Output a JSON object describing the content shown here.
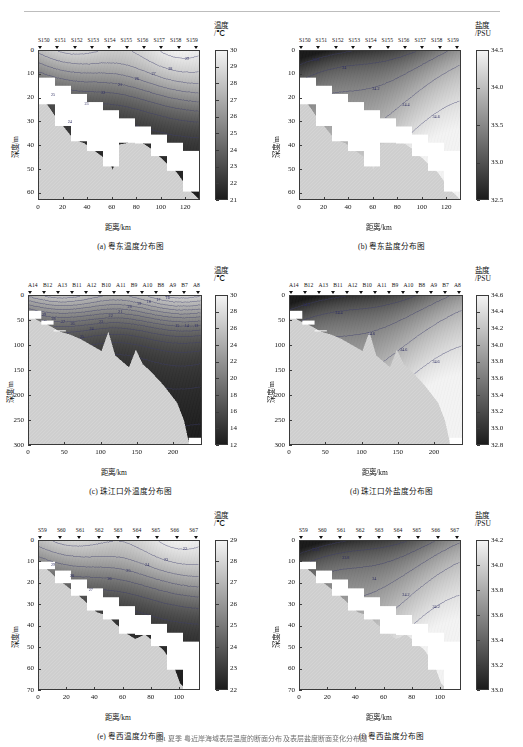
{
  "header": {
    "running_head": "",
    "figure_caption": "图1  夏季  粤近岸海域表层温度的断面分布  及表层盐度断面变化分布图"
  },
  "axis_labels": {
    "x": "距离/km",
    "y_depth": "深度/m",
    "temp_unit": "温度\n/℃",
    "temp_unit_line1": "温度",
    "temp_unit_line2": "/℃",
    "sal_unit_line1": "盐度",
    "sal_unit_line2": "/PSU"
  },
  "panels": [
    {
      "id": "a",
      "caption": "(a) 粤东温度分布图",
      "variable": "temperature",
      "stations": [
        "S150",
        "S151",
        "S152",
        "S153",
        "S154",
        "S155",
        "S156",
        "S157",
        "S158",
        "S159"
      ],
      "colorbar": {
        "title_l1": "温度",
        "title_l2": "/℃",
        "ticks": [
          30,
          29,
          28,
          27,
          26,
          25,
          24,
          23,
          22,
          21
        ],
        "min": 21,
        "max": 30
      },
      "chart_data": {
        "type": "heatmap",
        "title": "(a) 粤东温度分布图",
        "xlabel": "距离/km",
        "ylabel": "深度/m",
        "xlim": [
          0,
          132
        ],
        "ylim": [
          0,
          63
        ],
        "xticks": [
          0,
          20,
          40,
          60,
          80,
          100,
          120
        ],
        "yticks": [
          0,
          10,
          20,
          30,
          40,
          50,
          60
        ],
        "zlabel": "温度/℃",
        "zlim": [
          21,
          30
        ],
        "grid": false,
        "legend": "colorbar-right",
        "station_positions_km": [
          5,
          14,
          29,
          43,
          57,
          71,
          86,
          100,
          117,
          130
        ],
        "contour_levels": [
          21,
          22,
          23,
          24,
          25,
          26,
          27,
          28,
          29
        ],
        "contour_labels": [
          "25",
          "24",
          "23",
          "22",
          "21",
          "26",
          "27",
          "28",
          "29"
        ],
        "description": "粤东断面温度垂向分布，表层约30℃，底层约21℃，温跃层位于10-20 m"
      }
    },
    {
      "id": "b",
      "caption": "(b) 粤东盐度分布图",
      "variable": "salinity",
      "stations": [
        "S150",
        "S151",
        "S152",
        "S153",
        "S154",
        "S155",
        "S156",
        "S157",
        "S158",
        "S159"
      ],
      "colorbar": {
        "title_l1": "盐度",
        "title_l2": "/PSU",
        "ticks": [
          34.5,
          34.0,
          33.5,
          33.0,
          32.5
        ],
        "min": 32.5,
        "max": 34.5
      },
      "chart_data": {
        "type": "heatmap",
        "title": "(b) 粤东盐度分布图",
        "xlabel": "距离/km",
        "ylabel": "深度/m",
        "xlim": [
          0,
          132
        ],
        "ylim": [
          0,
          63
        ],
        "xticks": [
          0,
          20,
          40,
          60,
          80,
          100,
          120
        ],
        "yticks": [
          0,
          10,
          20,
          30,
          40,
          50,
          60
        ],
        "zlabel": "盐度/PSU",
        "zlim": [
          32.5,
          34.5
        ],
        "grid": false,
        "legend": "colorbar-right",
        "station_positions_km": [
          5,
          14,
          29,
          43,
          57,
          71,
          86,
          100,
          117,
          130
        ],
        "contour_levels": [
          33.8,
          34.0,
          34.2,
          34.4,
          34.6
        ],
        "contour_labels": [
          "33.8",
          "34",
          "34.2",
          "34.4",
          "34.6"
        ],
        "description": "粤东断面盐度垂向分布，近表层盐度较低，深层约34.5 PSU"
      }
    },
    {
      "id": "c",
      "caption": "(c) 珠江口外温度分布图",
      "variable": "temperature",
      "stations": [
        "A14",
        "B12",
        "A13",
        "B11",
        "A12",
        "B10",
        "A11",
        "B9",
        "A10",
        "B8",
        "A9",
        "B7",
        "A8"
      ],
      "colorbar": {
        "title_l1": "温度",
        "title_l2": "/℃",
        "ticks": [
          30,
          28,
          26,
          24,
          22,
          20,
          18,
          16,
          14,
          12
        ],
        "min": 12,
        "max": 30
      },
      "chart_data": {
        "type": "heatmap",
        "title": "(c) 珠江口外温度分布图",
        "xlabel": "距离/km",
        "ylabel": "深度/m",
        "xlim": [
          0,
          240
        ],
        "ylim": [
          0,
          300
        ],
        "xticks": [
          0,
          50,
          100,
          150,
          200
        ],
        "yticks": [
          0,
          50,
          100,
          150,
          200,
          250,
          300
        ],
        "zlabel": "温度/℃",
        "zlim": [
          12,
          30
        ],
        "grid": false,
        "legend": "colorbar-right",
        "station_positions_km": [
          2,
          17,
          36,
          55,
          78,
          97,
          117,
          138,
          160,
          180,
          199,
          219,
          238
        ],
        "contour_levels": [
          12,
          13,
          14,
          15,
          16,
          17,
          18,
          19,
          20,
          21,
          22,
          23,
          24,
          25,
          26,
          27,
          28,
          29
        ],
        "contour_labels": [
          "29",
          "28",
          "27",
          "26",
          "25",
          "24",
          "23",
          "22",
          "21",
          "20",
          "19",
          "18",
          "17",
          "16",
          "15",
          "14",
          "13"
        ],
        "description": "珠江口外断面温度垂向分布，0-300 m，表层30℃递减至底层12℃"
      }
    },
    {
      "id": "d",
      "caption": "(d) 珠江口外盐度分布图",
      "variable": "salinity",
      "stations": [
        "A14",
        "B12",
        "A13",
        "B11",
        "A12",
        "B10",
        "A11",
        "B9",
        "A10",
        "B8",
        "A9",
        "B7",
        "A8"
      ],
      "colorbar": {
        "title_l1": "盐度",
        "title_l2": "/PSU",
        "ticks": [
          34.6,
          34.4,
          34.2,
          34.0,
          33.8,
          33.6,
          33.4,
          33.2,
          33.0,
          32.8
        ],
        "min": 32.8,
        "max": 34.6
      },
      "chart_data": {
        "type": "heatmap",
        "title": "(d) 珠江口外盐度分布图",
        "xlabel": "距离/km",
        "ylabel": "深度/m",
        "xlim": [
          0,
          240
        ],
        "ylim": [
          0,
          300
        ],
        "xticks": [
          0,
          50,
          100,
          150,
          200
        ],
        "yticks": [
          0,
          50,
          100,
          150,
          200,
          250,
          300
        ],
        "zlabel": "盐度/PSU",
        "zlim": [
          32.8,
          34.6
        ],
        "grid": false,
        "legend": "colorbar-right",
        "station_positions_km": [
          2,
          17,
          36,
          55,
          78,
          97,
          117,
          138,
          160,
          180,
          199,
          219,
          238
        ],
        "contour_levels": [
          33.2,
          33.6,
          34.2,
          34.4,
          34.6
        ],
        "contour_labels": [
          "34.2",
          "34.4",
          "34.6",
          "34.6",
          "34.6"
        ],
        "description": "珠江口外断面盐度垂向分布，近岸低盐水团，深层高盐水约34.6 PSU"
      }
    },
    {
      "id": "e",
      "caption": "(e) 粤西温度分布图",
      "variable": "temperature",
      "stations": [
        "S59",
        "S60",
        "S61",
        "S62",
        "S63",
        "S64",
        "S65",
        "S66",
        "S67"
      ],
      "colorbar": {
        "title_l1": "温度",
        "title_l2": "/℃",
        "ticks": [
          29,
          28,
          27,
          26,
          25,
          24,
          23,
          22
        ],
        "min": 22,
        "max": 29
      },
      "chart_data": {
        "type": "heatmap",
        "title": "(e) 粤西温度分布图",
        "xlabel": "距离/km",
        "ylabel": "深度/m",
        "xlim": [
          0,
          115
        ],
        "ylim": [
          0,
          70
        ],
        "xticks": [
          0,
          20,
          40,
          60,
          80,
          100
        ],
        "yticks": [
          0,
          10,
          20,
          30,
          40,
          50,
          60,
          70
        ],
        "zlabel": "温度/℃",
        "zlim": [
          22,
          29
        ],
        "grid": false,
        "legend": "colorbar-right",
        "station_positions_km": [
          1,
          14,
          29,
          44,
          58,
          72,
          87,
          101,
          114
        ],
        "contour_levels": [
          22,
          23,
          24,
          25,
          26,
          27,
          28,
          29
        ],
        "contour_labels": [
          "29",
          "28",
          "27",
          "26",
          "25",
          "24",
          "23",
          "22"
        ],
        "description": "粤西断面温度垂向分布，表层约29℃，底层约22℃"
      }
    },
    {
      "id": "f",
      "caption": "(f) 粤西盐度分布图",
      "variable": "salinity",
      "stations": [
        "S59",
        "S60",
        "S61",
        "S62",
        "S63",
        "S64",
        "S65",
        "S66",
        "S67"
      ],
      "colorbar": {
        "title_l1": "盐度",
        "title_l2": "/PSU",
        "ticks": [
          34.2,
          34.0,
          33.8,
          33.6,
          33.4,
          33.2,
          33.0
        ],
        "min": 33.0,
        "max": 34.2
      },
      "chart_data": {
        "type": "heatmap",
        "title": "(f) 粤西盐度分布图",
        "xlabel": "距离/km",
        "ylabel": "深度/m",
        "xlim": [
          0,
          115
        ],
        "ylim": [
          0,
          70
        ],
        "xticks": [
          0,
          20,
          40,
          60,
          80,
          100
        ],
        "yticks": [
          0,
          10,
          20,
          30,
          40,
          50,
          60,
          70
        ],
        "zlabel": "盐度/PSU",
        "zlim": [
          33.0,
          34.2
        ],
        "grid": false,
        "legend": "colorbar-right",
        "station_positions_km": [
          1,
          14,
          29,
          44,
          58,
          72,
          87,
          101,
          114
        ],
        "contour_levels": [
          33.2,
          33.4,
          33.6,
          33.8,
          34.0,
          34.2
        ],
        "contour_labels": [
          "33.6",
          "33.8",
          "34",
          "34.2",
          "34.2"
        ],
        "description": "粤西断面盐度垂向分布，近岸表层低盐约33.0 PSU，外海约34.2 PSU"
      }
    }
  ]
}
